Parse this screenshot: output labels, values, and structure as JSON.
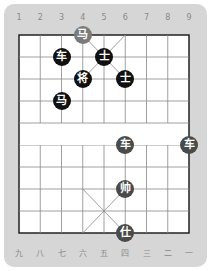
{
  "board": {
    "top_labels": [
      "1",
      "2",
      "3",
      "4",
      "5",
      "6",
      "7",
      "8",
      "9"
    ],
    "bottom_labels": [
      "九",
      "八",
      "七",
      "六",
      "五",
      "四",
      "三",
      "二",
      "一"
    ],
    "colors": {
      "frame": "#d6d6d6",
      "board": "#ffffff",
      "line": "#888888",
      "black_piece": "#111111",
      "red_piece": "#4a4a4a",
      "highlight_piece": "#7a7a7a"
    }
  },
  "pieces": [
    {
      "char": "马",
      "side": "highlight",
      "col": 4,
      "row": 0
    },
    {
      "char": "士",
      "side": "black",
      "col": 5,
      "row": 1
    },
    {
      "char": "车",
      "side": "black",
      "col": 3,
      "row": 1
    },
    {
      "char": "将",
      "side": "black",
      "col": 4,
      "row": 2
    },
    {
      "char": "士",
      "side": "black",
      "col": 6,
      "row": 2
    },
    {
      "char": "马",
      "side": "black",
      "col": 3,
      "row": 3
    },
    {
      "char": "车",
      "side": "red",
      "col": 6,
      "row": 5
    },
    {
      "char": "车",
      "side": "red",
      "col": 9,
      "row": 5
    },
    {
      "char": "帅",
      "side": "red",
      "col": 6,
      "row": 7
    },
    {
      "char": "仕",
      "side": "red",
      "col": 6,
      "row": 9
    }
  ]
}
